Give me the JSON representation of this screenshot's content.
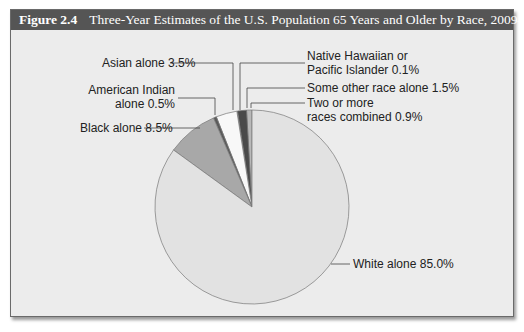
{
  "figure": {
    "number": "Figure 2.4",
    "title": "Three-Year Estimates of the U.S. Population 65 Years and Older by Race, 2009–2011"
  },
  "labels": {
    "asian": "Asian alone 3.5%",
    "american_indian_1": "American Indian",
    "american_indian_2": "alone 0.5%",
    "black": "Black alone 8.5%",
    "nhpi_1": "Native Hawaiian or",
    "nhpi_2": "Pacific Islander 0.1%",
    "some_other": "Some other race alone 1.5%",
    "two_more_1": "Two or more",
    "two_more_2": "races combined 0.9%",
    "white": "White alone 85.0%"
  },
  "chart_data": {
    "type": "pie",
    "title": "Three-Year Estimates of the U.S. Population 65 Years and Older by Race, 2009–2011",
    "categories": [
      "White alone",
      "Black alone",
      "American Indian alone",
      "Asian alone",
      "Native Hawaiian or Pacific Islander",
      "Some other race alone",
      "Two or more races combined"
    ],
    "values": [
      85.0,
      8.5,
      0.5,
      3.5,
      0.1,
      1.5,
      0.9
    ],
    "unit": "%",
    "colors": [
      "#e2e2e2",
      "#a8a8a8",
      "#5a5a5a",
      "#f8f8f8",
      "#888888",
      "#4a4a4a",
      "#b8b8b8"
    ],
    "legend": "callout labels"
  }
}
